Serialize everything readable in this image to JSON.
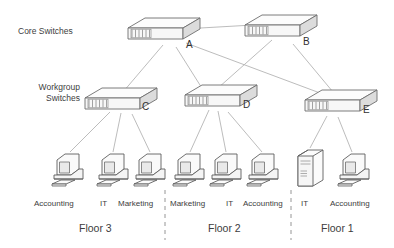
{
  "diagram": {
    "side_labels": {
      "core": "Core Switches",
      "workgroup_line1": "Workgroup",
      "workgroup_line2": "Switches"
    },
    "core_switches": [
      {
        "id": "A",
        "label": "A",
        "x": 160,
        "y": 24
      },
      {
        "id": "B",
        "label": "B",
        "x": 276,
        "y": 22
      }
    ],
    "workgroup_switches": [
      {
        "id": "C",
        "label": "C",
        "x": 100,
        "y": 92
      },
      {
        "id": "D",
        "label": "D",
        "x": 204,
        "y": 89
      },
      {
        "id": "E",
        "label": "E",
        "x": 320,
        "y": 95
      }
    ],
    "endpoints": [
      {
        "id": "pc1",
        "type": "workstation",
        "dept": "Accounting",
        "floor": "Floor 3",
        "x": 57,
        "y": 152,
        "switch": "C"
      },
      {
        "id": "pc2",
        "type": "workstation",
        "dept": "IT",
        "floor": "Floor 3",
        "x": 101,
        "y": 152,
        "switch": "C"
      },
      {
        "id": "pc3",
        "type": "workstation",
        "dept": "Marketing",
        "floor": "Floor 3",
        "x": 139,
        "y": 152,
        "switch": "C"
      },
      {
        "id": "pc4",
        "type": "workstation",
        "dept": "Marketing",
        "floor": "Floor 2",
        "x": 178,
        "y": 152,
        "switch": "D"
      },
      {
        "id": "pc5",
        "type": "workstation",
        "dept": "IT",
        "floor": "Floor 2",
        "x": 215,
        "y": 152,
        "switch": "D"
      },
      {
        "id": "pc6",
        "type": "workstation",
        "dept": "Accounting",
        "floor": "Floor 2",
        "x": 253,
        "y": 152,
        "switch": "D"
      },
      {
        "id": "srv1",
        "type": "server",
        "dept": "IT",
        "floor": "Floor 1",
        "x": 301,
        "y": 150,
        "switch": "E"
      },
      {
        "id": "pc7",
        "type": "workstation",
        "dept": "Accounting",
        "floor": "Floor 1",
        "x": 343,
        "y": 152,
        "switch": "E"
      }
    ],
    "dept_labels": [
      {
        "text": "Accounting",
        "x": 34,
        "y": 199
      },
      {
        "text": "IT",
        "x": 100,
        "y": 199
      },
      {
        "text": "Marketing",
        "x": 118,
        "y": 199
      },
      {
        "text": "Marketing",
        "x": 172,
        "y": 199
      },
      {
        "text": "IT",
        "x": 228,
        "y": 199
      },
      {
        "text": "Accounting",
        "x": 245,
        "y": 199
      },
      {
        "text": "IT",
        "x": 303,
        "y": 199
      },
      {
        "text": "Accounting",
        "x": 332,
        "y": 199
      }
    ],
    "floor_labels": [
      {
        "text": "Floor 3",
        "x": 79,
        "y": 224
      },
      {
        "text": "Floor 2",
        "x": 210,
        "y": 224
      },
      {
        "text": "Floor 1",
        "x": 323,
        "y": 224
      }
    ],
    "dividers": [
      {
        "id": "divider-floor3-floor2",
        "x": 165
      },
      {
        "id": "divider-floor2-floor1",
        "x": 291
      }
    ],
    "links": [
      {
        "from": "A",
        "to": "B"
      },
      {
        "from": "A",
        "to": "C"
      },
      {
        "from": "A",
        "to": "D"
      },
      {
        "from": "A",
        "to": "E"
      },
      {
        "from": "B",
        "to": "D"
      },
      {
        "from": "B",
        "to": "E"
      }
    ],
    "colors": {
      "line": "#b4b4b4",
      "device_stroke": "#6e6e6e",
      "device_fill": "#fbfbfb",
      "device_shade": "#e3e3e3",
      "text": "#3d3d3d",
      "background": "#ffffff"
    }
  }
}
